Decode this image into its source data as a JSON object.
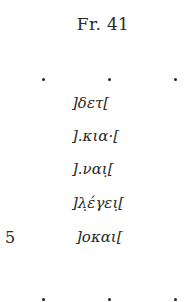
{
  "fragment": {
    "title": "Fr. 41",
    "lines": [
      {
        "n": "",
        "text": "]δετ["
      },
      {
        "n": "",
        "text": "].κια·["
      },
      {
        "n": "",
        "text": "].ναι̣["
      },
      {
        "n": "",
        "text": "]λ̣έγει̣["
      },
      {
        "n": "5",
        "text": "]οκαι["
      }
    ],
    "ellipsis_dots_top": ". . .",
    "ellipsis_dots_bottom": ". . ."
  }
}
